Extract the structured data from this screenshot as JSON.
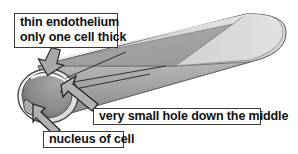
{
  "figure": {
    "background_color": "#ffffff",
    "callouts": [
      {
        "id": "endothelium",
        "line1": "thin endothelium",
        "line2": "only one cell thick",
        "points_to": "vessel-wall"
      },
      {
        "id": "hole",
        "text": "very small hole down the middle",
        "points_to": "lumen"
      },
      {
        "id": "nucleus",
        "text": "nucleus of cell",
        "points_to": "cell-nucleus"
      }
    ],
    "colors": {
      "outline": "#3a3a3a",
      "text": "#111111",
      "tube_light": "#d8d8d8",
      "tube_mid": "#b4b4b4",
      "tube_dark": "#8e8e8e",
      "lumen_dark": "#6f6f6f",
      "rim_white": "#f2f2f2",
      "arrow_fill": "#a8a8a8"
    },
    "parts": {
      "tube_label": "capillary-tube",
      "opening_label": "capillary-opening",
      "lumen_label": "capillary-lumen",
      "nucleus_label": "cell-nucleus",
      "rim_label": "endothelium-rim"
    }
  }
}
